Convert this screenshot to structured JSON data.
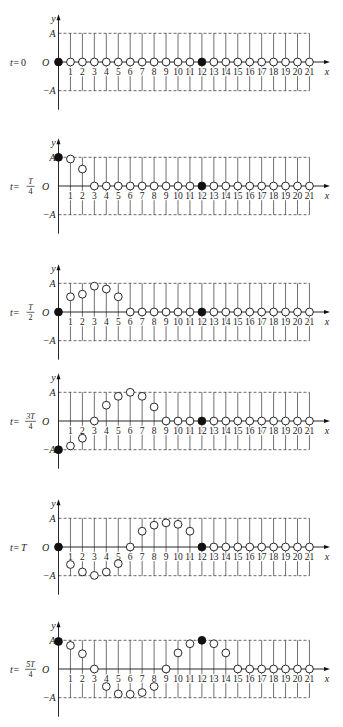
{
  "figure": {
    "axis_labels": {
      "y": "y",
      "x": "x",
      "amplitude_pos": "A",
      "origin": "O",
      "amplitude_neg": "−A"
    },
    "x_ticks": [
      "1",
      "2",
      "3",
      "4",
      "5",
      "6",
      "7",
      "8",
      "9",
      "10",
      "11",
      "12",
      "13",
      "14",
      "15",
      "16",
      "17",
      "18",
      "19",
      "20",
      "21"
    ],
    "filled_point_color": "#111111",
    "open_point_color": "#ffffff",
    "panels": [
      {
        "id": "t-0",
        "time_label": {
          "prefix": "t=",
          "value": "0"
        },
        "filled_indices": [
          0,
          12
        ],
        "y_values": [
          0,
          0,
          0,
          0,
          0,
          0,
          0,
          0,
          0,
          0,
          0,
          0,
          0,
          0,
          0,
          0,
          0,
          0,
          0,
          0,
          0,
          0
        ]
      },
      {
        "id": "t-T-4",
        "time_label": {
          "prefix": "t=",
          "numerator": "T",
          "denominator": "4"
        },
        "filled_indices": [
          0,
          12
        ],
        "y_values": [
          1.0,
          0.94,
          0.59,
          0,
          0,
          0,
          0,
          0,
          0,
          0,
          0,
          0,
          0,
          0,
          0,
          0,
          0,
          0,
          0,
          0,
          0,
          0
        ]
      },
      {
        "id": "t-T-2",
        "time_label": {
          "prefix": "t=",
          "numerator": "T",
          "denominator": "2"
        },
        "filled_indices": [
          0,
          12
        ],
        "y_values": [
          0,
          0.53,
          0.62,
          0.9,
          0.8,
          0.53,
          0,
          0,
          0,
          0,
          0,
          0,
          0,
          0,
          0,
          0,
          0,
          0,
          0,
          0,
          0,
          0
        ]
      },
      {
        "id": "t-3T-4",
        "time_label": {
          "prefix": "t=",
          "numerator": "3T",
          "denominator": "4"
        },
        "filled_indices": [
          0,
          12
        ],
        "y_values": [
          -1.0,
          -0.87,
          -0.6,
          0,
          0.55,
          0.86,
          1.0,
          0.86,
          0.49,
          0,
          0,
          0,
          0,
          0,
          0,
          0,
          0,
          0,
          0,
          0,
          0,
          0
        ]
      },
      {
        "id": "t-T",
        "time_label": {
          "prefix": "t=",
          "value": "T"
        },
        "filled_indices": [
          0,
          12
        ],
        "y_values": [
          0,
          -0.61,
          -0.87,
          -0.99,
          -0.87,
          -0.58,
          0,
          0.55,
          0.76,
          0.84,
          0.79,
          0.55,
          0,
          0,
          0,
          0,
          0,
          0,
          0,
          0,
          0,
          0
        ]
      },
      {
        "id": "t-5T-4",
        "time_label": {
          "prefix": "t=",
          "numerator": "5T",
          "denominator": "4"
        },
        "filled_indices": [
          0,
          12
        ],
        "y_values": [
          0.96,
          0.82,
          0.53,
          0,
          -0.61,
          -0.87,
          -0.88,
          -0.82,
          -0.61,
          0,
          0.56,
          0.88,
          1.0,
          0.88,
          0.56,
          0,
          0,
          0,
          0,
          0,
          0,
          0
        ]
      }
    ]
  }
}
